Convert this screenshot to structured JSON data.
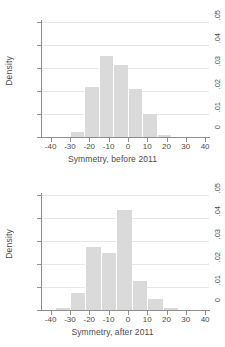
{
  "chart_data": [
    {
      "type": "bar",
      "title": "",
      "xlabel": "Symmetry, before 2011",
      "ylabel": "Density",
      "xlim": [
        -45,
        42
      ],
      "ylim": [
        0,
        0.05
      ],
      "grid": true,
      "legend": "none",
      "xticks": [
        -40,
        -30,
        -20,
        -10,
        0,
        10,
        20,
        30,
        40
      ],
      "xtick_labels": [
        "-40",
        "-30",
        "-20",
        "-10",
        "0",
        "10",
        "20",
        "30",
        "40"
      ],
      "yticks": [
        0,
        0.01,
        0.02,
        0.03,
        0.04,
        0.05
      ],
      "ytick_labels": [
        "0",
        ".01",
        ".02",
        ".03",
        ".04",
        ".05"
      ],
      "bin_width": 7.5,
      "bars": [
        {
          "x0": -30.0,
          "x1": -22.5,
          "value": 0.0022
        },
        {
          "x0": -22.5,
          "x1": -15.0,
          "value": 0.0218
        },
        {
          "x0": -15.0,
          "x1": -7.5,
          "value": 0.0353
        },
        {
          "x0": -7.5,
          "x1": 0.0,
          "value": 0.0312
        },
        {
          "x0": 0.0,
          "x1": 7.5,
          "value": 0.0207
        },
        {
          "x0": 7.5,
          "x1": 15.0,
          "value": 0.0101
        },
        {
          "x0": 15.0,
          "x1": 22.5,
          "value": 0.001
        }
      ]
    },
    {
      "type": "bar",
      "title": "",
      "xlabel": "Symmetry, after 2011",
      "ylabel": "Density",
      "xlim": [
        -45,
        42
      ],
      "ylim": [
        0,
        0.05
      ],
      "grid": true,
      "legend": "none",
      "xticks": [
        -40,
        -30,
        -20,
        -10,
        0,
        10,
        20,
        30,
        40
      ],
      "xtick_labels": [
        "-40",
        "-30",
        "-20",
        "-10",
        "0",
        "10",
        "20",
        "30",
        "40"
      ],
      "yticks": [
        0,
        0.01,
        0.02,
        0.03,
        0.04,
        0.05
      ],
      "ytick_labels": [
        "0",
        ".01",
        ".02",
        ".03",
        ".04",
        ".05"
      ],
      "bin_width": 8.0,
      "bars": [
        {
          "x0": -38.0,
          "x1": -30.0,
          "value": 0.0008
        },
        {
          "x0": -30.0,
          "x1": -22.0,
          "value": 0.0074
        },
        {
          "x0": -22.0,
          "x1": -14.0,
          "value": 0.0274
        },
        {
          "x0": -14.0,
          "x1": -6.0,
          "value": 0.0246
        },
        {
          "x0": -6.0,
          "x1": 2.0,
          "value": 0.0434
        },
        {
          "x0": 2.0,
          "x1": 10.0,
          "value": 0.0124
        },
        {
          "x0": 10.0,
          "x1": 18.0,
          "value": 0.0049
        },
        {
          "x0": 18.0,
          "x1": 26.0,
          "value": 0.0007
        }
      ]
    }
  ],
  "style": {
    "bar_fill": "#dadada",
    "axis_color": "#8d8d8d",
    "grid_color": "#e6e6e6",
    "text_color": "#4a4a4a",
    "background": "#ffffff"
  }
}
